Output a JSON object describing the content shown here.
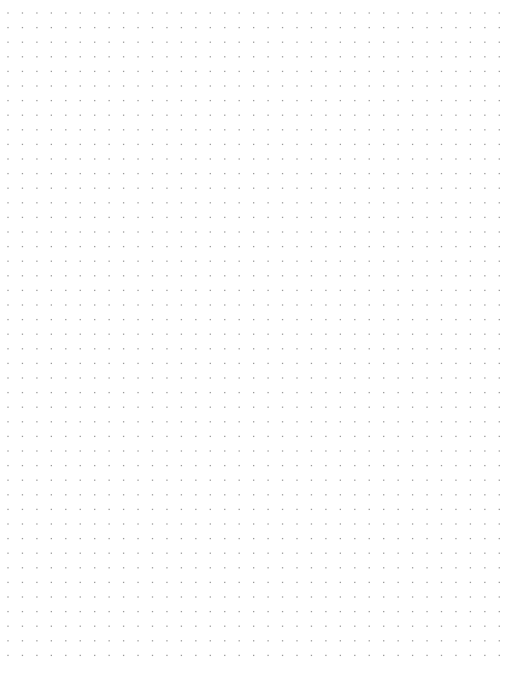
{
  "page": {
    "type": "dot-grid-paper",
    "background_color": "#ffffff",
    "dot_color": "#9a9a9a",
    "dot_size_px": 1.3,
    "spacing_x_px": 14.45,
    "spacing_y_px": 14.6,
    "origin_x_px": 8,
    "origin_y_px": 13,
    "columns": 35,
    "rows": 45
  }
}
